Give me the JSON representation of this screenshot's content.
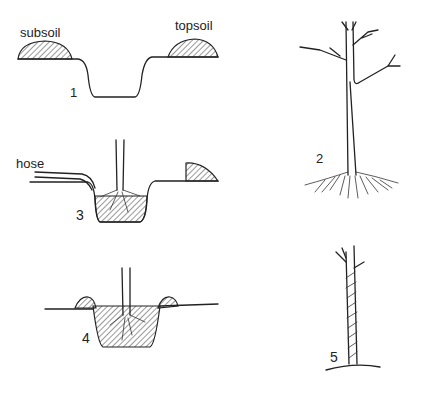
{
  "diagram": {
    "panels": [
      {
        "step": "1",
        "description": "Dug planting hole with soil piles",
        "labels": {
          "left_pile": "subsoil",
          "right_pile": "topsoil"
        }
      },
      {
        "step": "2",
        "description": "Bare-root tree with spread roots"
      },
      {
        "step": "3",
        "description": "Tree placed in hole, watered with hose",
        "labels": {
          "hose": "hose"
        }
      },
      {
        "step": "4",
        "description": "Hole backfilled, ridge formed around tree"
      },
      {
        "step": "5",
        "description": "Trunk wrapped with protective spiral"
      }
    ]
  }
}
